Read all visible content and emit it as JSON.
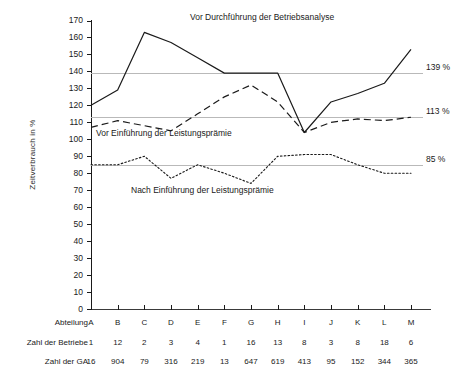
{
  "chart_data": {
    "type": "line",
    "title": "",
    "xlabel": "Abteilung",
    "ylabel": "Zeitverbrauch in %",
    "categories": [
      "A",
      "B",
      "C",
      "D",
      "E",
      "F",
      "G",
      "H",
      "I",
      "J",
      "K",
      "L",
      "M"
    ],
    "ylim": [
      0,
      170
    ],
    "ytick_step": 10,
    "yticks": [
      170,
      160,
      150,
      140,
      130,
      120,
      110,
      100,
      90,
      80,
      70,
      60,
      50,
      40,
      30,
      20,
      10,
      0
    ],
    "grid": "horizontal reference lines only",
    "legend": "inline annotations next to each curve",
    "series": [
      {
        "name": "Vor Durchführung der Betriebsanalyse",
        "style": "solid",
        "values": [
          120,
          129,
          163,
          157,
          148,
          139,
          139,
          139,
          104,
          122,
          127,
          133,
          153
        ]
      },
      {
        "name": "Vor Einführung der Leistungsprämie",
        "style": "dashed",
        "values": [
          107,
          111,
          108,
          105,
          115,
          125,
          132,
          122,
          104,
          110,
          112,
          111,
          113
        ]
      },
      {
        "name": "Nach Einführung der Leistungsprämie",
        "style": "dotted",
        "values": [
          85,
          85,
          90,
          77,
          85,
          80,
          74,
          90,
          91,
          91,
          85,
          80,
          80
        ]
      }
    ],
    "reference_lines": [
      {
        "value": 139,
        "label": "139 %"
      },
      {
        "value": 113,
        "label": "113 %"
      },
      {
        "value": 85,
        "label": "85 %"
      }
    ]
  },
  "table": {
    "rows": [
      {
        "label": "Abteilung",
        "values": [
          "A",
          "B",
          "C",
          "D",
          "E",
          "F",
          "G",
          "H",
          "I",
          "J",
          "K",
          "L",
          "M"
        ]
      },
      {
        "label": "Zahl der Betriebe",
        "values": [
          "1",
          "12",
          "2",
          "3",
          "4",
          "1",
          "16",
          "13",
          "8",
          "3",
          "8",
          "18",
          "6"
        ]
      },
      {
        "label": "Zahl der GA",
        "values": [
          "16",
          "904",
          "79",
          "316",
          "219",
          "13",
          "647",
          "619",
          "413",
          "95",
          "152",
          "344",
          "365"
        ]
      }
    ]
  },
  "caption": {
    "text": ""
  }
}
